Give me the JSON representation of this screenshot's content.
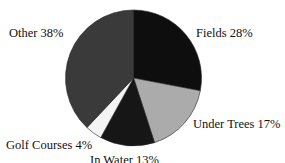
{
  "chart_data": {
    "type": "pie",
    "title": "",
    "start_angle_deg": 0,
    "direction": "clockwise",
    "center": [
      133.5,
      78
    ],
    "radius": 68,
    "slices": [
      {
        "label": "Fields",
        "value": 28,
        "display": "Fields 28%",
        "color": "#0e0e0e"
      },
      {
        "label": "Under Trees",
        "value": 17,
        "display": "Under Trees 17%",
        "color": "#ababab"
      },
      {
        "label": "In Water",
        "value": 13,
        "display": "In Water 13%",
        "color": "#161616"
      },
      {
        "label": "Golf Courses",
        "value": 4,
        "display": "Golf Courses 4%",
        "color": "#f4f4f4"
      },
      {
        "label": "Other",
        "value": 38,
        "display": "Other 38%",
        "color": "#3a3a3a"
      }
    ],
    "legend": "none (labels adjacent to slices)"
  },
  "labels": {
    "fields": "Fields 28%",
    "under_trees": "Under Trees 17%",
    "in_water": "In Water 13%",
    "golf_courses": "Golf Courses 4%",
    "other": "Other 38%"
  }
}
